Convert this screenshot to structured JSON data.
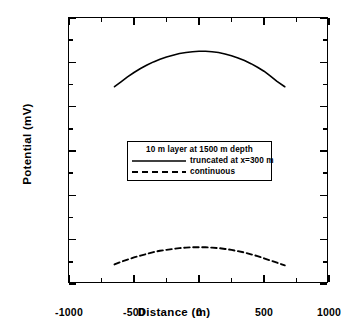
{
  "chart_data": {
    "type": "line",
    "title": "",
    "xlabel": "Distance (m)",
    "ylabel": "Potential (mV)",
    "xlim": [
      -1000,
      1000
    ],
    "ylim": [
      300,
      900
    ],
    "xticks": [
      -1000,
      -500,
      0,
      500,
      1000
    ],
    "xtick_labels": [
      "-1000",
      "-500",
      "0",
      "500",
      "1000"
    ],
    "xticks_minor": [
      -750,
      -250,
      250,
      750
    ],
    "yticks": [
      300,
      400,
      500,
      600,
      700,
      800,
      900
    ],
    "ytick_labels": [
      "300",
      "400",
      "500",
      "600",
      "700",
      "800",
      "900"
    ],
    "yticks_minor": [
      350,
      450,
      550,
      650,
      750,
      850
    ],
    "grid": false,
    "legend_position": "center",
    "legend_title": "10 m layer at 1500 m depth",
    "series": [
      {
        "name": "truncated at x=300 m",
        "style": "solid",
        "color": "#000000",
        "x": [
          -650,
          -600,
          -550,
          -500,
          -450,
          -400,
          -350,
          -300,
          -250,
          -200,
          -150,
          -100,
          -50,
          0,
          50,
          100,
          150,
          200,
          250,
          300,
          350,
          400,
          450,
          500,
          550,
          600,
          660
        ],
        "y": [
          745,
          756,
          767,
          777,
          786,
          794,
          801,
          807,
          812,
          816,
          820,
          822,
          824,
          825,
          825,
          824,
          822,
          819,
          815,
          810,
          804,
          797,
          789,
          780,
          769,
          757,
          745
        ]
      },
      {
        "name": "continuous",
        "style": "dashed",
        "color": "#000000",
        "x": [
          -650,
          -600,
          -550,
          -500,
          -450,
          -400,
          -350,
          -300,
          -250,
          -200,
          -150,
          -100,
          -50,
          0,
          50,
          100,
          150,
          200,
          250,
          300,
          350,
          400,
          450,
          500,
          550,
          600,
          660
        ],
        "y": [
          344,
          350,
          355,
          360,
          364,
          368,
          372,
          375,
          377,
          379,
          381,
          382,
          383,
          383,
          383,
          382,
          381,
          379,
          377,
          374,
          371,
          367,
          363,
          358,
          353,
          348,
          342
        ]
      }
    ]
  },
  "axes": {
    "x_title": "Distance (m)",
    "y_title": "Potential (mV)"
  },
  "legend": {
    "title": "10 m layer at 1500 m depth",
    "entries": [
      {
        "label": "truncated at x=300 m",
        "style": "solid"
      },
      {
        "label": "continuous",
        "style": "dashed"
      }
    ]
  }
}
